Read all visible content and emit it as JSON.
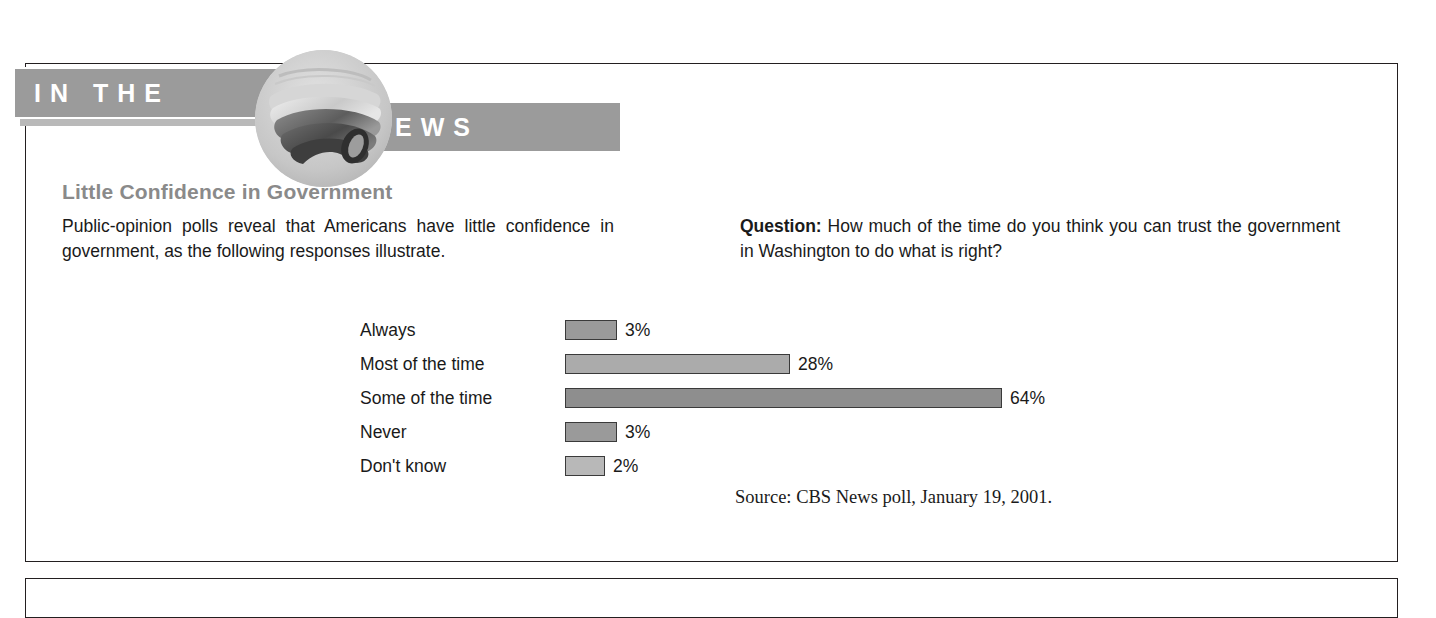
{
  "banner": {
    "left_text": "IN THE",
    "right_text": "NEWS",
    "photo_alt": "newspaper-photo"
  },
  "article": {
    "headline": "Little Confidence in Government",
    "intro": "Public-opinion polls reveal that Americans have little confidence in government, as the following responses illustrate.",
    "question_label": "Question:",
    "question_text": " How much of the time do you think you can trust the government in Washington to do what is right?",
    "source": "Source: CBS News poll, January 19, 2001."
  },
  "chart_data": {
    "type": "bar",
    "orientation": "horizontal",
    "title": "Little Confidence in Government",
    "categories": [
      "Always",
      "Most of the time",
      "Some of the time",
      "Never",
      "Don't know"
    ],
    "values": [
      3,
      28,
      64,
      3,
      2
    ],
    "value_labels": [
      "3%",
      "28%",
      "64%",
      "3%",
      "2%"
    ],
    "unit": "%",
    "xlabel": "",
    "ylabel": "",
    "xlim": [
      0,
      70
    ],
    "grid": false,
    "legend": false,
    "bar_colors": [
      "#9a9a9a",
      "#ababab",
      "#8e8e8e",
      "#9a9a9a",
      "#b8b8b8"
    ],
    "bar_pixel_widths": [
      52,
      225,
      437,
      52,
      40
    ],
    "source": "Source: CBS News poll, January 19, 2001.",
    "question": "How much of the time do you think you can trust the government in Washington to do what is right?"
  }
}
